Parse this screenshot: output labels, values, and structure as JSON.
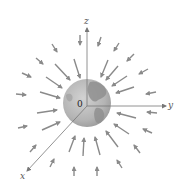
{
  "figure": {
    "axes": {
      "z_label": "z",
      "y_label": "y",
      "x_label": "x",
      "origin_label": "0"
    },
    "colors": {
      "arrow": "#8a8a8a",
      "axis": "#777777",
      "earth_base": "#b9b9b9",
      "earth_land": "#8e8e8e",
      "background": "#ffffff"
    },
    "earth": {
      "cx": 87,
      "cy": 103,
      "r": 24
    },
    "origin": {
      "x": 87,
      "y": 106
    },
    "arrows_inner": [
      {
        "x1": 74,
        "y1": 59,
        "x2": 80,
        "y2": 78
      },
      {
        "x1": 108,
        "y1": 60,
        "x2": 101,
        "y2": 77
      },
      {
        "x1": 118,
        "y1": 66,
        "x2": 106,
        "y2": 80
      },
      {
        "x1": 127,
        "y1": 76,
        "x2": 112,
        "y2": 86
      },
      {
        "x1": 134,
        "y1": 87,
        "x2": 116,
        "y2": 93
      },
      {
        "x1": 55,
        "y1": 64,
        "x2": 70,
        "y2": 80
      },
      {
        "x1": 46,
        "y1": 77,
        "x2": 62,
        "y2": 88
      },
      {
        "x1": 40,
        "y1": 92,
        "x2": 60,
        "y2": 98
      },
      {
        "x1": 37,
        "y1": 113,
        "x2": 57,
        "y2": 110
      },
      {
        "x1": 42,
        "y1": 130,
        "x2": 60,
        "y2": 122
      },
      {
        "x1": 69,
        "y1": 152,
        "x2": 75,
        "y2": 136
      },
      {
        "x1": 83,
        "y1": 156,
        "x2": 84,
        "y2": 138
      },
      {
        "x1": 100,
        "y1": 155,
        "x2": 95,
        "y2": 137
      },
      {
        "x1": 118,
        "y1": 147,
        "x2": 106,
        "y2": 131
      },
      {
        "x1": 129,
        "y1": 134,
        "x2": 114,
        "y2": 124
      },
      {
        "x1": 136,
        "y1": 118,
        "x2": 117,
        "y2": 113
      }
    ],
    "arrows_outer": [
      {
        "x1": 80,
        "y1": 35,
        "x2": 80,
        "y2": 45
      },
      {
        "x1": 101,
        "y1": 37,
        "x2": 98,
        "y2": 46
      },
      {
        "x1": 119,
        "y1": 43,
        "x2": 114,
        "y2": 51
      },
      {
        "x1": 134,
        "y1": 54,
        "x2": 127,
        "y2": 61
      },
      {
        "x1": 148,
        "y1": 69,
        "x2": 139,
        "y2": 74
      },
      {
        "x1": 156,
        "y1": 92,
        "x2": 146,
        "y2": 94
      },
      {
        "x1": 157,
        "y1": 113,
        "x2": 147,
        "y2": 112
      },
      {
        "x1": 152,
        "y1": 133,
        "x2": 143,
        "y2": 129
      },
      {
        "x1": 140,
        "y1": 153,
        "x2": 134,
        "y2": 145
      },
      {
        "x1": 122,
        "y1": 168,
        "x2": 117,
        "y2": 160
      },
      {
        "x1": 97,
        "y1": 176,
        "x2": 97,
        "y2": 167
      },
      {
        "x1": 74,
        "y1": 176,
        "x2": 74,
        "y2": 167
      },
      {
        "x1": 50,
        "y1": 167,
        "x2": 54,
        "y2": 159
      },
      {
        "x1": 30,
        "y1": 152,
        "x2": 36,
        "y2": 145
      },
      {
        "x1": 18,
        "y1": 128,
        "x2": 27,
        "y2": 126
      },
      {
        "x1": 16,
        "y1": 94,
        "x2": 26,
        "y2": 95
      },
      {
        "x1": 22,
        "y1": 73,
        "x2": 31,
        "y2": 77
      },
      {
        "x1": 36,
        "y1": 58,
        "x2": 43,
        "y2": 64
      },
      {
        "x1": 52,
        "y1": 44,
        "x2": 57,
        "y2": 52
      }
    ]
  }
}
